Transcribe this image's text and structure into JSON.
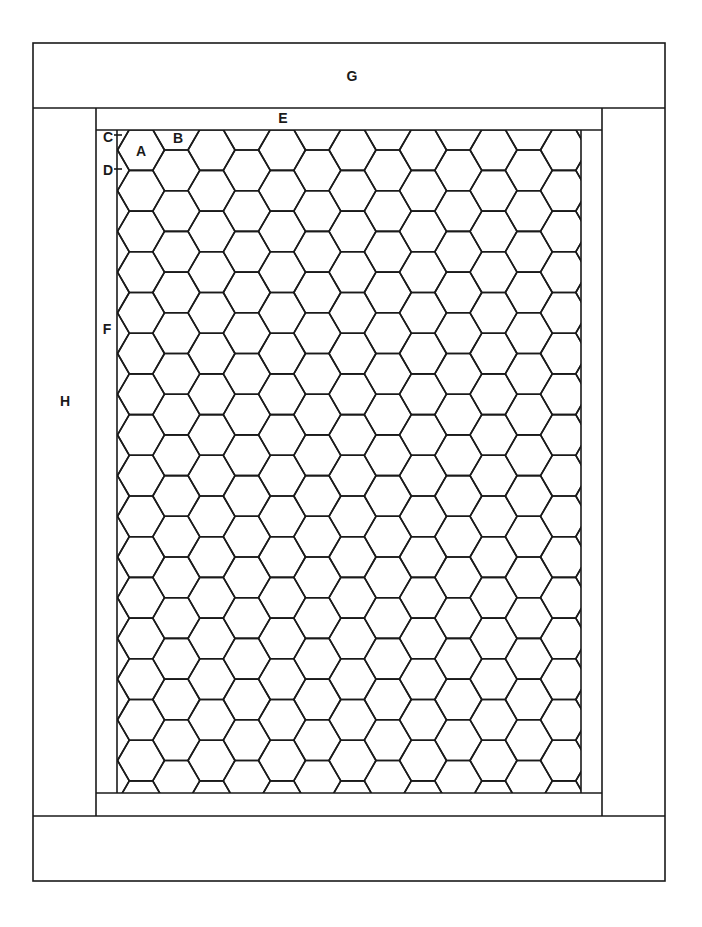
{
  "diagram": {
    "type": "frame-construction-diagram",
    "line_color": "#1a1a1a",
    "background": "#ffffff",
    "labels": {
      "A": "A",
      "B": "B",
      "C": "C",
      "D": "D",
      "E": "E",
      "F": "F",
      "G": "G",
      "H": "H"
    },
    "parts": [
      {
        "label": "G",
        "name": "top-band"
      },
      {
        "label": "H",
        "name": "left-band"
      },
      {
        "label": "E",
        "name": "top-inner-strip"
      },
      {
        "label": "F",
        "name": "left-inner-strip"
      },
      {
        "label": "A",
        "name": "full-hexagon-cell"
      },
      {
        "label": "B",
        "name": "truncated-edge-hexagon-cell"
      },
      {
        "label": "C",
        "name": "marker-c"
      },
      {
        "label": "D",
        "name": "marker-d"
      }
    ],
    "honeycomb": {
      "orientation": "flat-top",
      "columns": 14,
      "rows": 16
    }
  }
}
